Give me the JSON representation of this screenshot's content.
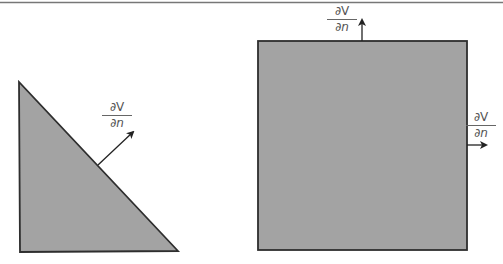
{
  "figure": {
    "top_rule": true,
    "colors": {
      "shape_fill": "#a3a3a3",
      "shape_stroke": "#2e2e2e",
      "arrow": "#222222",
      "label": "#555555",
      "top_rule": "#777777"
    },
    "shapes": [
      {
        "type": "triangle",
        "name": "right-triangle",
        "points": [
          [
            19,
            82
          ],
          [
            20,
            252
          ],
          [
            178,
            251
          ]
        ],
        "normal_arrow": {
          "from": [
            98,
            165
          ],
          "to": [
            133,
            132
          ]
        },
        "label": {
          "numerator": "∂V",
          "denominator": "∂n",
          "x": 102,
          "y": 101
        }
      },
      {
        "type": "square",
        "name": "square",
        "x": 258,
        "y": 41,
        "width": 209,
        "height": 209,
        "normal_arrows": [
          {
            "edge": "top",
            "from": [
              362,
              41
            ],
            "to": [
              362,
              20
            ],
            "label": {
              "numerator": "∂V",
              "denominator": "∂n",
              "x": 327,
              "y": 5
            }
          },
          {
            "edge": "right",
            "from": [
              467,
              145
            ],
            "to": [
              486,
              145
            ],
            "label": {
              "numerator": "∂V",
              "denominator": "∂n",
              "x": 466,
              "y": 111
            }
          }
        ]
      }
    ]
  }
}
